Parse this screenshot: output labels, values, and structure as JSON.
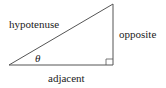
{
  "diagram": {
    "type": "right-triangle",
    "labels": {
      "hypotenuse": "hypotenuse",
      "opposite": "opposite",
      "adjacent": "adjacent",
      "angle": "θ"
    },
    "colors": {
      "stroke": "#555555",
      "text": "#222222"
    }
  }
}
